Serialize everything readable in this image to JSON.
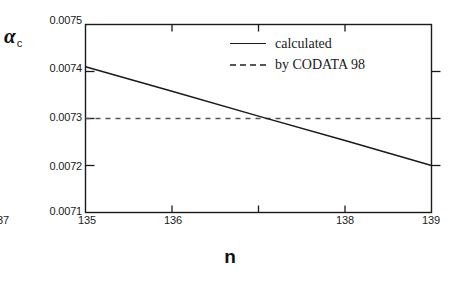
{
  "chart_data": {
    "type": "line",
    "title": "",
    "xlabel": "n",
    "ylabel": "α",
    "ylabel_sub": "c",
    "xlim": [
      135,
      139
    ],
    "ylim": [
      0.0071,
      0.0075
    ],
    "grid": false,
    "legend_position": "top-right",
    "xticks": [
      135,
      136,
      137,
      138,
      139
    ],
    "xtick_labels": [
      "135",
      "136",
      "137",
      "138",
      "139"
    ],
    "yticks": [
      0.0071,
      0.0072,
      0.0073,
      0.0074,
      0.0075
    ],
    "ytick_labels": [
      "0.0071",
      "0.0072",
      "0.0073",
      "0.0074",
      "0.0075"
    ],
    "series": [
      {
        "name": "calculated",
        "style": "solid",
        "color": "#1a1a1a",
        "x": [
          135,
          136,
          137,
          138,
          139
        ],
        "values": [
          0.00741,
          0.007358,
          0.007305,
          0.007253,
          0.0072
        ]
      },
      {
        "name": "by CODATA 98",
        "style": "dashed",
        "color": "#555555",
        "x": [
          135,
          139
        ],
        "values": [
          0.0073,
          0.0073
        ]
      }
    ],
    "annotations": [
      {
        "text": "crossing near n = 137 at 0.0073"
      }
    ]
  },
  "legend": {
    "items": [
      {
        "label": "calculated",
        "style": "solid"
      },
      {
        "label": "by CODATA 98",
        "style": "dashed"
      }
    ]
  },
  "axes": {
    "x_title": "n",
    "y_title": "α",
    "y_title_sub": "c"
  }
}
